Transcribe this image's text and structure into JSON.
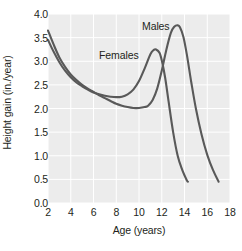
{
  "chart_data": {
    "type": "line",
    "title": "",
    "xlabel": "Age (years)",
    "ylabel": "Height gain (in./year)",
    "xlim": [
      2,
      18
    ],
    "ylim": [
      0.0,
      4.0
    ],
    "xticks": [
      2,
      4,
      6,
      8,
      10,
      12,
      14,
      16,
      18
    ],
    "xtick_labels": [
      "2",
      "4",
      "6",
      "8",
      "10",
      "12",
      "14",
      "16",
      "18"
    ],
    "yticks": [
      0.0,
      0.5,
      1.0,
      1.5,
      2.0,
      2.5,
      3.0,
      3.5,
      4.0
    ],
    "ytick_labels": [
      "0.0",
      "0.5",
      "1.0",
      "1.5",
      "2.0",
      "2.5",
      "3.0",
      "3.5",
      "4.0"
    ],
    "grid": true,
    "grid_color": "#ffffff",
    "panel_color": "#ececec",
    "line_color": "#595959",
    "legend": "inline-annotations",
    "series": [
      {
        "name": "Females",
        "label": "Females",
        "color": "#595959",
        "x": [
          2.0,
          2.5,
          3.0,
          3.5,
          4.0,
          4.5,
          5.0,
          5.5,
          6.0,
          6.5,
          7.0,
          7.5,
          8.0,
          8.5,
          9.0,
          9.5,
          10.0,
          10.5,
          11.0,
          11.3,
          11.5,
          11.8,
          12.0,
          12.3,
          12.6,
          13.0,
          13.4,
          13.8,
          14.2,
          14.3
        ],
        "y": [
          3.45,
          3.2,
          2.98,
          2.8,
          2.66,
          2.55,
          2.47,
          2.4,
          2.34,
          2.3,
          2.27,
          2.25,
          2.24,
          2.25,
          2.3,
          2.4,
          2.58,
          2.85,
          3.15,
          3.24,
          3.25,
          3.18,
          3.02,
          2.65,
          2.15,
          1.5,
          1.0,
          0.7,
          0.48,
          0.45
        ]
      },
      {
        "name": "Males",
        "label": "Males",
        "color": "#595959",
        "x": [
          2.0,
          2.5,
          3.0,
          3.5,
          4.0,
          4.5,
          5.0,
          5.5,
          6.0,
          6.5,
          7.0,
          7.5,
          8.0,
          8.5,
          9.0,
          9.5,
          10.0,
          10.5,
          10.8,
          11.2,
          11.6,
          12.0,
          12.4,
          12.8,
          13.1,
          13.4,
          13.6,
          13.9,
          14.2,
          14.6,
          15.0,
          15.5,
          16.0,
          16.5,
          17.0
        ],
        "y": [
          3.65,
          3.35,
          3.08,
          2.88,
          2.72,
          2.6,
          2.5,
          2.42,
          2.35,
          2.28,
          2.22,
          2.16,
          2.1,
          2.06,
          2.03,
          2.01,
          2.01,
          2.03,
          2.06,
          2.18,
          2.42,
          2.8,
          3.24,
          3.6,
          3.73,
          3.76,
          3.72,
          3.52,
          3.15,
          2.55,
          2.0,
          1.45,
          1.02,
          0.7,
          0.45
        ]
      }
    ],
    "annotations": [
      {
        "text": "Males",
        "x": 13.0,
        "y": 3.93
      },
      {
        "text": "Females",
        "x": 10.5,
        "y": 3.33
      }
    ]
  }
}
